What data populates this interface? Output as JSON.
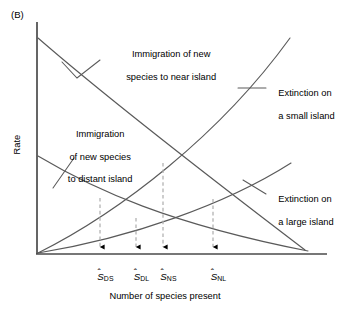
{
  "figure": {
    "panel_label": "(B)",
    "axis": {
      "x_title": "Number of species present",
      "y_title": "Rate"
    },
    "annotations": {
      "immigration_near_line1": "Immigration of new",
      "immigration_near_line2": "species to near island",
      "immigration_distant_line1": "Immigration",
      "immigration_distant_line2": "of new species",
      "immigration_distant_line3": "to distant island",
      "extinction_small_line1": "Extinction on",
      "extinction_small_line2": "a small island",
      "extinction_large_line1": "Extinction on",
      "extinction_large_line2": "a large island"
    },
    "equilibrium_ticks": [
      {
        "symbol": "S",
        "subscript": "DS",
        "meaning": "distant small island equilibrium"
      },
      {
        "symbol": "S",
        "subscript": "DL",
        "meaning": "distant large island equilibrium"
      },
      {
        "symbol": "S",
        "subscript": "NS",
        "meaning": "near small island equilibrium"
      },
      {
        "symbol": "S",
        "subscript": "NL",
        "meaning": "near large island equilibrium"
      }
    ],
    "colors": {
      "curve": "#5a5a5a",
      "axis": "#4a4a4a",
      "dashed": "#b0b0b0",
      "arrow": "#000000",
      "text": "#000000",
      "background": "#ffffff"
    }
  },
  "chart_data": {
    "type": "line",
    "title": "",
    "xlabel": "Number of species present",
    "ylabel": "Rate",
    "xlim": [
      0,
      100
    ],
    "ylim": [
      0,
      100
    ],
    "grid": false,
    "legend": "inline-annotations",
    "axis_ticks_shown": false,
    "series": [
      {
        "name": "Immigration of new species to near island",
        "kind": "immigration",
        "shape": "decreasing-slightly-convex",
        "x": [
          0,
          12,
          25,
          37,
          50,
          62,
          75,
          87,
          100
        ],
        "y": [
          75,
          66,
          57,
          48,
          39,
          30,
          21,
          12,
          3
        ],
        "start_point": [
          0,
          75
        ],
        "end_point": [
          100,
          3
        ]
      },
      {
        "name": "Immigration of new species to distant island",
        "kind": "immigration",
        "shape": "decreasing-convex",
        "x": [
          0,
          12,
          25,
          37,
          50,
          62,
          75,
          87,
          100
        ],
        "y": [
          42,
          35,
          29,
          24,
          19,
          14,
          10,
          6,
          2
        ],
        "start_point": [
          0,
          42
        ],
        "end_point": [
          100,
          2
        ]
      },
      {
        "name": "Extinction on a small island",
        "kind": "extinction",
        "shape": "increasing-slightly-concave-up",
        "x": [
          0,
          12,
          25,
          37,
          50,
          62,
          75,
          87
        ],
        "y": [
          0,
          8,
          18,
          29,
          42,
          56,
          71,
          88
        ],
        "start_point": [
          0,
          0
        ],
        "end_point": [
          87,
          88
        ]
      },
      {
        "name": "Extinction on a large island",
        "kind": "extinction",
        "shape": "increasing-slightly-concave-up",
        "x": [
          0,
          12,
          25,
          37,
          50,
          62,
          75,
          87
        ],
        "y": [
          0,
          4,
          9,
          14,
          20,
          27,
          34,
          42
        ],
        "start_point": [
          0,
          0
        ],
        "end_point": [
          87,
          42
        ]
      }
    ],
    "intersections": [
      {
        "label": "S_DS",
        "x": 25,
        "y": 29,
        "between": [
          "Immigration of new species to distant island",
          "Extinction on a small island"
        ]
      },
      {
        "label": "S_DL",
        "x": 41,
        "y": 16,
        "between": [
          "Immigration of new species to distant island",
          "Extinction on a large island"
        ]
      },
      {
        "label": "S_NS",
        "x": 53,
        "y": 45,
        "between": [
          "Immigration of new species to near island",
          "Extinction on a small island"
        ]
      },
      {
        "label": "S_NL",
        "x": 76,
        "y": 35,
        "between": [
          "Immigration of new species to near island",
          "Extinction on a large island"
        ]
      }
    ],
    "annotation_notes": "Four equilibrium species numbers marked by dashed drop-lines with arrowheads at the x-axis; axes are unscaled (qualitative MacArthur-Wilson island biogeography model)."
  }
}
